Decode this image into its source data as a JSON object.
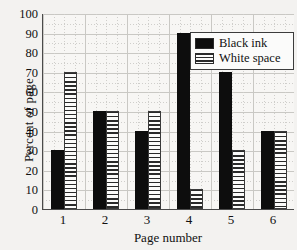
{
  "chart_data": {
    "type": "bar",
    "title": "",
    "xlabel": "Page number",
    "ylabel": "Percent of page",
    "categories": [
      "1",
      "2",
      "3",
      "4",
      "5",
      "6"
    ],
    "series": [
      {
        "name": "Black ink",
        "values": [
          30,
          50,
          40,
          90,
          70,
          40
        ],
        "color": "#0d0d0d",
        "fill": "solid"
      },
      {
        "name": "White space",
        "values": [
          70,
          50,
          50,
          10,
          30,
          40
        ],
        "color": "#fbfbfa",
        "fill": "horizontal-stripes"
      }
    ],
    "ylim": [
      0,
      100
    ],
    "yticks": [
      0,
      10,
      20,
      30,
      40,
      50,
      60,
      70,
      80,
      90,
      100
    ],
    "ytick_labels": [
      "0",
      "10",
      "20",
      "30",
      "40",
      "50",
      "60",
      "70",
      "80",
      "90",
      "100"
    ],
    "grid": true,
    "minor_grid": true,
    "legend_position": "top-right"
  },
  "legend": {
    "entries": [
      {
        "label": "Black ink"
      },
      {
        "label": "White space"
      }
    ]
  },
  "axes": {
    "x_title": "Page number",
    "y_title": "Percent of page"
  }
}
